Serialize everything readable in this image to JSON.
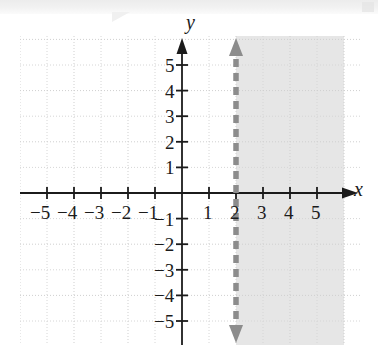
{
  "figure": {
    "kind": "coordinate-plane-graph",
    "axis_labels": {
      "x": "x",
      "y": "y"
    },
    "colors": {
      "axis": "#1b1b1b",
      "grid": "#d8d8d8",
      "shading": "#e6e6e6",
      "boundary_line": "#8c8c8c",
      "label_text": "#1b1b1b",
      "page_background": "#ffffff"
    }
  },
  "chart_data": {
    "type": "line",
    "title": "",
    "xlabel": "x",
    "ylabel": "y",
    "xlim": [
      -6,
      6
    ],
    "ylim": [
      -6,
      6
    ],
    "grid": true,
    "legend": "none",
    "x_ticks": [
      -5,
      -4,
      -3,
      -2,
      -1,
      1,
      2,
      3,
      4,
      5
    ],
    "y_ticks": [
      5,
      4,
      3,
      2,
      1,
      -1,
      -2,
      -3,
      -4,
      -5
    ],
    "x_tick_labels": [
      "-5",
      "-4",
      "-3",
      "-2",
      "-1",
      "1",
      "2",
      "3",
      "4",
      "5"
    ],
    "y_tick_labels": [
      "5",
      "4",
      "3",
      "2",
      "1",
      "-1",
      "-2",
      "-3",
      "-4",
      "-5"
    ],
    "series": [
      {
        "name": "boundary line x = 2",
        "equation": "x = 2",
        "style": "dashed",
        "color": "#8c8c8c",
        "arrow_start": true,
        "arrow_end": true,
        "x": [
          2,
          2
        ],
        "y": [
          -6,
          6
        ]
      }
    ],
    "shaded_region": {
      "name": "solution region",
      "inequality": "x > 2",
      "boundary_included": false,
      "side": "right",
      "color": "#e6e6e6",
      "x_range": [
        2,
        6
      ],
      "y_range": [
        -6,
        6
      ]
    },
    "annotations": []
  },
  "ticks": {
    "x_negative": [
      "-5",
      "-4",
      "-3",
      "-2",
      "-1"
    ],
    "x_positive": [
      "1",
      "2",
      "3",
      "4",
      "5"
    ],
    "y_positive": [
      "5",
      "4",
      "3",
      "2",
      "1"
    ],
    "y_negative": [
      "-1",
      "-2",
      "-3",
      "-4",
      "-5"
    ]
  }
}
